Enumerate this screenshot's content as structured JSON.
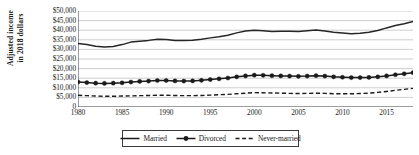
{
  "chart_data": {
    "type": "line",
    "title": "",
    "xlabel": "",
    "ylabel": "Adjusted income in 2018 dollars",
    "ylabel_line1": "Adjusted income",
    "ylabel_line2": "in 2018 dollars",
    "xlim": [
      1980,
      2018
    ],
    "ylim": [
      0,
      50000
    ],
    "ytick_step": 5000,
    "grid": true,
    "legend_position": "bottom-center",
    "ytick_labels": [
      "$50,000",
      "$45,000",
      "$40,000",
      "$35,000",
      "$30,000",
      "$25,000",
      "$20,000",
      "$15,000",
      "$10,000",
      "$5,000",
      "0"
    ],
    "ytick_values": [
      50000,
      45000,
      40000,
      35000,
      30000,
      25000,
      20000,
      15000,
      10000,
      5000,
      0
    ],
    "xtick_labels": [
      "1980",
      "1985",
      "1990",
      "1995",
      "2000",
      "2005",
      "2010",
      "2015"
    ],
    "xtick_values": [
      1980,
      1985,
      1990,
      1995,
      2000,
      2005,
      2010,
      2015
    ],
    "x": [
      1980,
      1981,
      1982,
      1983,
      1984,
      1985,
      1986,
      1987,
      1988,
      1989,
      1990,
      1991,
      1992,
      1993,
      1994,
      1995,
      1996,
      1997,
      1998,
      1999,
      2000,
      2001,
      2002,
      2003,
      2004,
      2005,
      2006,
      2007,
      2008,
      2009,
      2010,
      2011,
      2012,
      2013,
      2014,
      2015,
      2016,
      2017,
      2018
    ],
    "series": [
      {
        "name": "Married",
        "style": "solid",
        "marker": "none",
        "color": "#262626",
        "values": [
          33100,
          32500,
          31600,
          31300,
          31500,
          32500,
          33800,
          34300,
          34700,
          35300,
          35200,
          34700,
          34600,
          34800,
          35300,
          36000,
          36600,
          37400,
          38600,
          39600,
          40000,
          39700,
          39300,
          39400,
          39400,
          39300,
          39700,
          40100,
          39600,
          38900,
          38500,
          38200,
          38400,
          38900,
          39800,
          41200,
          42400,
          43400,
          44600
        ]
      },
      {
        "name": "Divorced",
        "style": "solid",
        "marker": "circle",
        "color": "#1a1a1a",
        "values": [
          13000,
          12700,
          12400,
          12300,
          12400,
          12600,
          13000,
          13300,
          13500,
          13800,
          13800,
          13600,
          13500,
          13600,
          13900,
          14300,
          14700,
          15100,
          15700,
          16200,
          16600,
          16500,
          16300,
          16200,
          16100,
          16000,
          16100,
          16300,
          16100,
          15700,
          15500,
          15300,
          15300,
          15400,
          15700,
          16200,
          16800,
          17300,
          17900
        ]
      },
      {
        "name": "Never-married",
        "style": "dashed",
        "marker": "none",
        "color": "#1a1a1a",
        "values": [
          6100,
          5900,
          5700,
          5600,
          5600,
          5700,
          5800,
          5900,
          6000,
          6100,
          6100,
          6000,
          5900,
          5900,
          6000,
          6200,
          6400,
          6600,
          6900,
          7200,
          7500,
          7400,
          7300,
          7200,
          7100,
          7000,
          7100,
          7200,
          7100,
          6900,
          6900,
          6900,
          7000,
          7200,
          7600,
          8100,
          8700,
          9200,
          9700
        ]
      }
    ],
    "legend": [
      {
        "label": "Married",
        "style": "solid",
        "marker": "none"
      },
      {
        "label": "Divorced",
        "style": "solid",
        "marker": "circle"
      },
      {
        "label": "Never-married",
        "style": "dashed",
        "marker": "none"
      }
    ]
  },
  "colors": {
    "axis": "#3c3c3c",
    "grid": "#b8b8b8",
    "text": "#1a1a1a",
    "background": "#ffffff"
  }
}
